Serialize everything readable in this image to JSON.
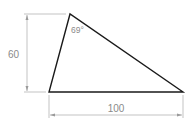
{
  "diagram": {
    "shape": "triangle",
    "vertices": {
      "apex": [
        70,
        14
      ],
      "bottom_left": [
        49,
        92
      ],
      "bottom_right": [
        183,
        92
      ]
    },
    "angle_label": "69°",
    "height_dimension": "60",
    "base_dimension": "100",
    "colors": {
      "outline": "#1a1a1a",
      "dimension": "#9a9a9a",
      "text": "#8a8a8a"
    }
  }
}
